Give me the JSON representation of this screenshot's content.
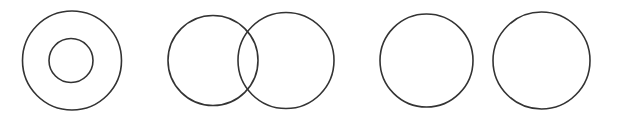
{
  "figure": {
    "canvas": {
      "width": 617,
      "height": 122,
      "background_color": "#ffffff"
    },
    "style": {
      "stroke_color": "#333333",
      "stroke_width": 1.6,
      "fill": "none"
    },
    "groups": [
      {
        "name": "concentric-circles",
        "label": "Concentric circles",
        "relationship": "containment",
        "circles": [
          {
            "name": "outer-circle",
            "cx": 72,
            "cy": 60.5,
            "r": 49.5
          },
          {
            "name": "inner-circle",
            "cx": 71,
            "cy": 60.5,
            "r": 22
          }
        ]
      },
      {
        "name": "intersecting-circles",
        "label": "Intersecting circles",
        "relationship": "overlap",
        "circles": [
          {
            "name": "left-circle",
            "cx": 213,
            "cy": 60.5,
            "r": 45
          },
          {
            "name": "right-circle",
            "cx": 286,
            "cy": 60.5,
            "r": 48
          }
        ]
      },
      {
        "name": "disjoint-circle-left",
        "label": "Separate circle, left",
        "relationship": "disjoint",
        "circles": [
          {
            "name": "standalone-circle-a",
            "cx": 426.5,
            "cy": 60.5,
            "r": 46.5
          }
        ]
      },
      {
        "name": "disjoint-circle-right",
        "label": "Separate circle, right",
        "relationship": "disjoint",
        "circles": [
          {
            "name": "standalone-circle-b",
            "cx": 541.5,
            "cy": 60.5,
            "r": 48.5
          }
        ]
      }
    ]
  }
}
